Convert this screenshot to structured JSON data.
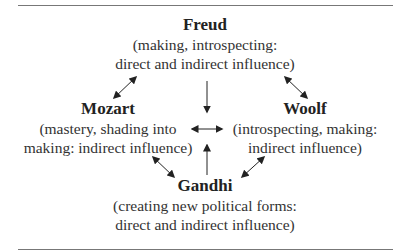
{
  "diagram": {
    "nodes": {
      "freud": {
        "name": "Freud",
        "desc_lines": [
          "(making, introspecting:",
          "direct and indirect influence)"
        ]
      },
      "mozart": {
        "name": "Mozart",
        "desc_lines": [
          "(mastery, shading into",
          "making: indirect influence)"
        ]
      },
      "woolf": {
        "name": "Woolf",
        "desc_lines": [
          "(introspecting, making:",
          "indirect influence)"
        ]
      },
      "gandhi": {
        "name": "Gandhi",
        "desc_lines": [
          "(creating new political forms:",
          "direct and indirect influence)"
        ]
      }
    },
    "edges": [
      {
        "from": "Freud",
        "to": "Mozart",
        "type": "bidirectional"
      },
      {
        "from": "Freud",
        "to": "Woolf",
        "type": "bidirectional"
      },
      {
        "from": "Freud",
        "to": "center",
        "type": "directed"
      },
      {
        "from": "Mozart",
        "to": "Woolf",
        "type": "bidirectional"
      },
      {
        "from": "Gandhi",
        "to": "center",
        "type": "directed"
      },
      {
        "from": "Mozart",
        "to": "Gandhi",
        "type": "bidirectional"
      },
      {
        "from": "Woolf",
        "to": "Gandhi",
        "type": "bidirectional"
      }
    ]
  }
}
